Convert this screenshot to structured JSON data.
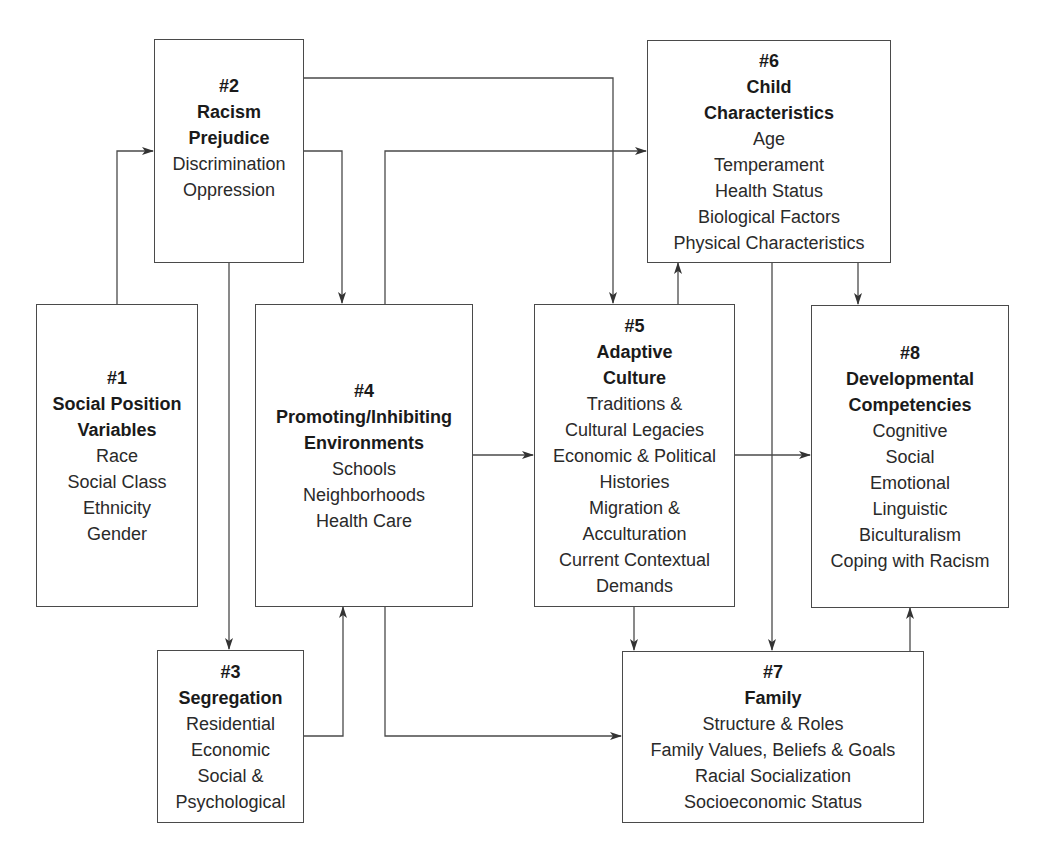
{
  "diagram": {
    "line_color": "#4a4a4a",
    "boxes": {
      "b1": {
        "num": "#1",
        "title": [
          "Social Position",
          "Variables"
        ],
        "items": [
          "Race",
          "Social Class",
          "Ethnicity",
          "Gender"
        ]
      },
      "b2": {
        "num": "#2",
        "title": [
          "Racism",
          "Prejudice"
        ],
        "items": [
          "Discrimination",
          "Oppression"
        ]
      },
      "b3": {
        "num": "#3",
        "title": [
          "Segregation"
        ],
        "items": [
          "Residential",
          "Economic",
          "Social &",
          "Psychological"
        ]
      },
      "b4": {
        "num": "#4",
        "title": [
          "Promoting/Inhibiting",
          "Environments"
        ],
        "items": [
          "Schools",
          "Neighborhoods",
          "Health Care"
        ]
      },
      "b5": {
        "num": "#5",
        "title": [
          "Adaptive",
          "Culture"
        ],
        "items": [
          "Traditions &",
          "Cultural Legacies",
          "Economic & Political",
          "Histories",
          "Migration &",
          "Acculturation",
          "Current Contextual",
          "Demands"
        ]
      },
      "b6": {
        "num": "#6",
        "title": [
          "Child",
          "Characteristics"
        ],
        "items": [
          "Age",
          "Temperament",
          "Health Status",
          "Biological Factors",
          "Physical Characteristics"
        ]
      },
      "b7": {
        "num": "#7",
        "title": [
          "Family"
        ],
        "items": [
          "Structure & Roles",
          "Family Values, Beliefs & Goals",
          "Racial Socialization",
          "Socioeconomic Status"
        ]
      },
      "b8": {
        "num": "#8",
        "title": [
          "Developmental",
          "Competencies"
        ],
        "items": [
          "Cognitive",
          "Social",
          "Emotional",
          "Linguistic",
          "Biculturalism",
          "Coping with Racism"
        ]
      }
    },
    "edges": [
      {
        "from": "#1",
        "to": "#2"
      },
      {
        "from": "#2",
        "to": "#3"
      },
      {
        "from": "#2",
        "to": "#4"
      },
      {
        "from": "#2",
        "to": "#5"
      },
      {
        "from": "#3",
        "to": "#4"
      },
      {
        "from": "#4",
        "to": "#5"
      },
      {
        "from": "#4",
        "to": "#6"
      },
      {
        "from": "#4",
        "to": "#7"
      },
      {
        "from": "#5",
        "to": "#6"
      },
      {
        "from": "#5",
        "to": "#7"
      },
      {
        "from": "#5",
        "to": "#8"
      },
      {
        "from": "#6",
        "to": "#7"
      },
      {
        "from": "#6",
        "to": "#8"
      },
      {
        "from": "#7",
        "to": "#8"
      }
    ]
  }
}
